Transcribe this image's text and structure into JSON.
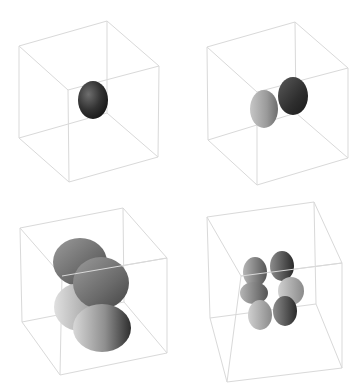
{
  "figure": {
    "description": "Four 3D renderings of orbital-like lobed surfaces, each inside a wireframe bounding cube, arranged in a 2x2 grid",
    "background": "#ffffff",
    "edge_color": "#d9d9d9",
    "panels": [
      {
        "id": "panel-1",
        "position": "top-left",
        "shape": "single dark ellipsoid lobe",
        "lobe_count": 1
      },
      {
        "id": "panel-2",
        "position": "top-right",
        "shape": "two lobes side by side (one light, one dark)",
        "lobe_count": 2
      },
      {
        "id": "panel-3",
        "position": "bottom-left",
        "shape": "four large overlapping ellipsoid lobes",
        "lobe_count": 4
      },
      {
        "id": "panel-4",
        "position": "bottom-right",
        "shape": "clover of small lobes (six visible)",
        "lobe_count": 6
      }
    ]
  }
}
